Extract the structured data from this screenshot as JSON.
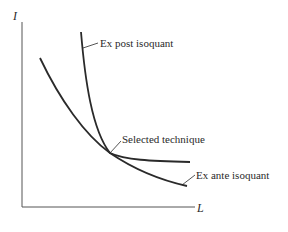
{
  "diagram": {
    "axes": {
      "y_label": "I",
      "x_label": "L"
    },
    "labels": {
      "ex_post": "Ex post isoquant",
      "selected": "Selected technique",
      "ex_ante": "Ex ante isoquant"
    },
    "colors": {
      "line": "#2a2a2a",
      "axis": "#555555",
      "background": "#ffffff"
    }
  }
}
